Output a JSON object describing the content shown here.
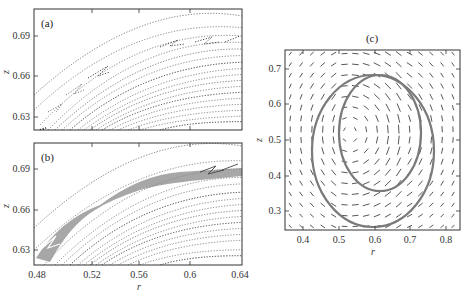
{
  "figure": {
    "panels": [
      {
        "id": "a",
        "label": "(a)"
      },
      {
        "id": "b",
        "label": "(b)"
      },
      {
        "id": "c",
        "label": "(c)"
      }
    ]
  },
  "chart_data": [
    {
      "type": "scatter",
      "panel": "(a)",
      "title": "(a)",
      "xlabel": "r",
      "ylabel": "z",
      "xlim": [
        0.478,
        0.645
      ],
      "ylim": [
        0.62,
        0.71
      ],
      "xticks": [
        0.48,
        0.52,
        0.56,
        0.6,
        0.64
      ],
      "xtick_labels_shown": false,
      "yticks": [
        0.63,
        0.66,
        0.69
      ],
      "ytick_labels": [
        "0.63",
        "0.66",
        "0.69"
      ],
      "description": "Poincaré section: nested arc-shaped invariant curves with small island chains (chevron-shaped resonances) near upper-left"
    },
    {
      "type": "scatter",
      "panel": "(b)",
      "title": "(b)",
      "xlabel": "r",
      "ylabel": "z",
      "xlim": [
        0.478,
        0.645
      ],
      "ylim": [
        0.62,
        0.71
      ],
      "xticks": [
        0.48,
        0.52,
        0.56,
        0.6,
        0.64
      ],
      "xtick_labels": [
        "0.48",
        "0.52",
        "0.56",
        "0.6",
        "0.64"
      ],
      "yticks": [
        0.63,
        0.66,
        0.69
      ],
      "ytick_labels": [
        "0.63",
        "0.66",
        "0.69"
      ],
      "description": "Poincaré section with a broadened chaotic layer (dense grey band) between island chains along an arc"
    },
    {
      "type": "vector_field",
      "panel": "(c)",
      "title": "(c)",
      "xlabel": "r",
      "ylabel": "z",
      "xlim": [
        0.35,
        0.85
      ],
      "ylim": [
        0.25,
        0.75
      ],
      "xticks": [
        0.4,
        0.5,
        0.6,
        0.7,
        0.8
      ],
      "xtick_labels": [
        "0.4",
        "0.5",
        "0.6",
        "0.7",
        "0.8"
      ],
      "yticks": [
        0.3,
        0.4,
        0.5,
        0.6,
        0.7
      ],
      "ytick_labels": [
        "0.3",
        "0.4",
        "0.5",
        "0.6",
        "0.7"
      ],
      "vortex_center": [
        0.6,
        0.52
      ],
      "curves": [
        {
          "name": "outer closed streamline",
          "center": [
            0.595,
            0.49
          ],
          "semi_axes": [
            0.17,
            0.2
          ]
        },
        {
          "name": "inner closed streamline",
          "center": [
            0.615,
            0.53
          ],
          "semi_axes": [
            0.115,
            0.16
          ]
        }
      ],
      "description": "Arrow plot of a toroidal vortex velocity field with two overlaid grey closed trajectories"
    }
  ]
}
